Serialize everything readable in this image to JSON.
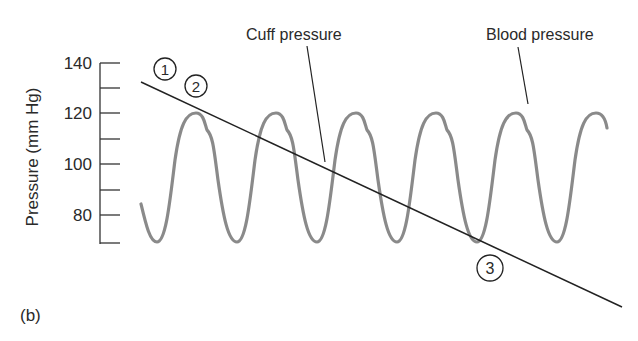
{
  "figure": {
    "panel_label": "(b)",
    "y_axis": {
      "label": "Pressure (mm Hg)",
      "ticks": [
        "140",
        "120",
        "100",
        "80"
      ],
      "range": [
        70,
        140
      ]
    },
    "annotations": {
      "cuff": "Cuff pressure",
      "blood": "Blood pressure"
    },
    "markers": [
      "1",
      "2",
      "3"
    ]
  },
  "colors": {
    "wave": "#8a8a8a",
    "line": "#222222",
    "text": "#2a2a2a"
  }
}
